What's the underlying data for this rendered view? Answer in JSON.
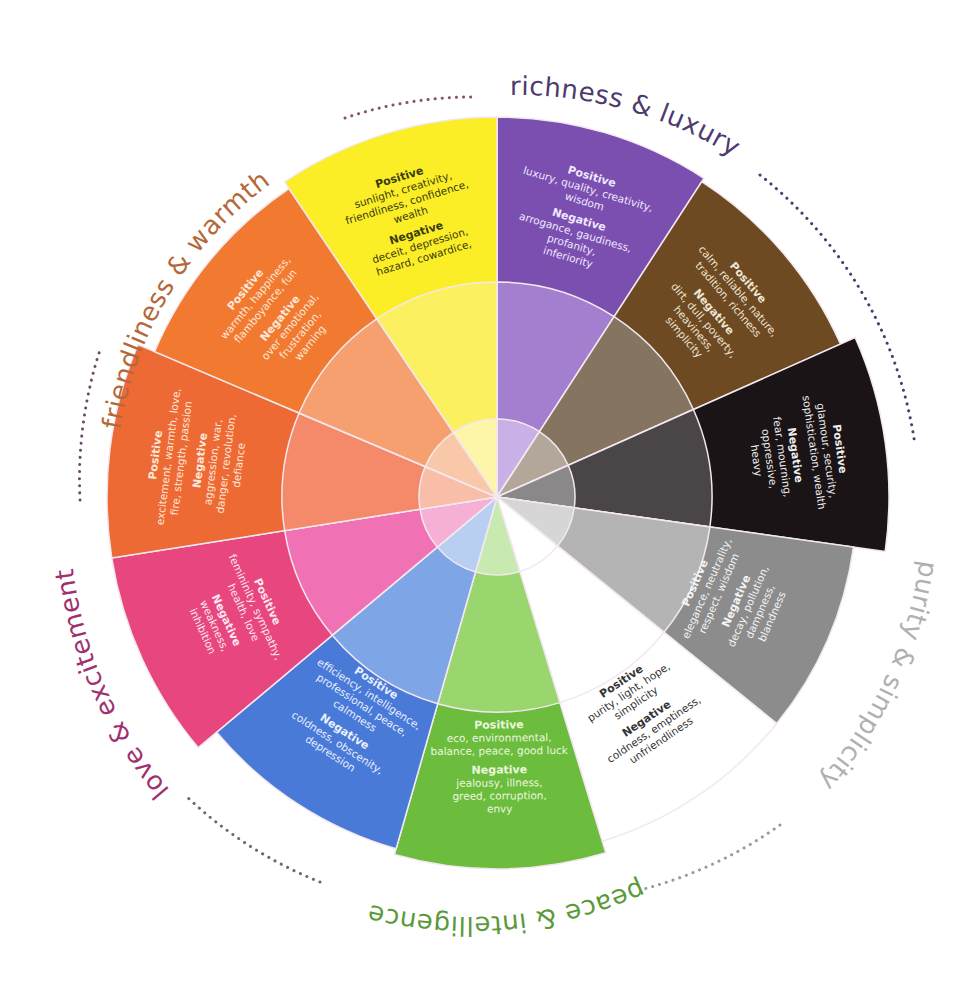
{
  "center": {
    "x": 497,
    "y": 497
  },
  "categories": [
    {
      "id": "friendliness",
      "label": "friendliness & warmth",
      "color": "#b4683a",
      "dot_color": "#8a4d6e"
    },
    {
      "id": "richness",
      "label": "richness & luxury",
      "color": "#4e3a6e",
      "dot_color": "#4e3a6e"
    },
    {
      "id": "purity",
      "label": "purity & simplicity",
      "color": "#b0b0b0",
      "dot_color": "#9a9a9a"
    },
    {
      "id": "peace",
      "label": "peace & intelligence",
      "color": "#5a9a3a",
      "dot_color": "#6a6a6a"
    },
    {
      "id": "love",
      "label": "love & excitement",
      "color": "#a0306e",
      "dot_color": "#6a4a6a"
    }
  ],
  "segments": [
    {
      "id": "purple",
      "color": "#7b4fb0",
      "mid": "#a47fd0",
      "inner": "#c9b0e6",
      "start": 0,
      "end": 33,
      "r": 380,
      "text_color": "#f0e8ff",
      "positive_label": "Positive",
      "positive": [
        "luxury, quality, creativity,",
        "wisdom"
      ],
      "negative_label": "Negative",
      "negative": [
        "arrogance, gaudiness,",
        "profanity,",
        "inferiority"
      ]
    },
    {
      "id": "brown",
      "color": "#6e4a22",
      "mid": "#857560",
      "inner": "#b3a79a",
      "start": 33,
      "end": 66,
      "r": 376,
      "text_color": "#efe6d6",
      "positive_label": "Positive",
      "positive": [
        "calm, reliable, nature,",
        "tradition, richness"
      ],
      "negative_label": "Negative",
      "negative": [
        "dirt, dull, poverty,",
        "heaviness,",
        "simplicity"
      ]
    },
    {
      "id": "black",
      "color": "#1a1416",
      "mid": "#4a4648",
      "inner": "#8a8888",
      "start": 66,
      "end": 98,
      "r": 392,
      "text_color": "#eeeeee",
      "positive_label": "Positive",
      "positive": [
        "glamour, security,",
        "sophistication, wealth"
      ],
      "negative_label": "Negative",
      "negative": [
        "fear, mourning,",
        "oppressive,",
        "heavy"
      ]
    },
    {
      "id": "gray",
      "color": "#8c8c8c",
      "mid": "#b4b4b4",
      "inner": "#d6d6d6",
      "start": 98,
      "end": 129,
      "r": 360,
      "text_color": "#f4f4f4",
      "positive_label": "Positive",
      "positive": [
        "elegance, neutrality,",
        "respect, wisdom"
      ],
      "negative_label": "Negative",
      "negative": [
        "decay, pollution,",
        "dampness,",
        "blandness"
      ]
    },
    {
      "id": "white",
      "color": "#ffffff",
      "mid": "#ffffff",
      "inner": "#ffffff",
      "start": 129,
      "end": 163,
      "r": 360,
      "text_color": "#333333",
      "positive_label": "Positive",
      "positive": [
        "purity, light, hope,",
        "simplicity"
      ],
      "negative_label": "Negative",
      "negative": [
        "coldness, emptiness,",
        "unfriendliness"
      ]
    },
    {
      "id": "green",
      "color": "#6cbc3e",
      "mid": "#9ad66e",
      "inner": "#c8eab0",
      "start": 163,
      "end": 196,
      "r": 372,
      "text_color": "#eaf8de",
      "positive_label": "Positive",
      "positive": [
        "eco, environmental,",
        "balance, peace, good luck"
      ],
      "negative_label": "Negative",
      "negative": [
        "jealousy, illness,",
        "greed, corruption,",
        "envy"
      ]
    },
    {
      "id": "blue",
      "color": "#4a7ad8",
      "mid": "#7ea6e6",
      "inner": "#b8cff2",
      "start": 196,
      "end": 230,
      "r": 366,
      "text_color": "#e8f0ff",
      "positive_label": "Positive",
      "positive": [
        "efficiency, intelligence,",
        "professional, peace,",
        "calmness"
      ],
      "negative_label": "Negative",
      "negative": [
        "coldness, obscenity,",
        "depression"
      ]
    },
    {
      "id": "pink",
      "color": "#e8467e",
      "mid": "#f072b4",
      "inner": "#f6b0d4",
      "start": 230,
      "end": 261,
      "r": 390,
      "text_color": "#fde6ef",
      "positive_label": "Positive",
      "positive": [
        "femininity, sympathy,",
        "health, love"
      ],
      "negative_label": "Negative",
      "negative": [
        "weakness,",
        "inhibition"
      ]
    },
    {
      "id": "red-orange",
      "color": "#ee6a34",
      "mid": "#f58a6a",
      "inner": "#f8bea8",
      "start": 261,
      "end": 293,
      "r": 390,
      "text_color": "#fde8dc",
      "positive_label": "Positive",
      "positive": [
        "excitement, warmth, love,",
        "fire, strength, passion"
      ],
      "negative_label": "Negative",
      "negative": [
        "aggression, war,",
        "danger, revolution,",
        "defiance"
      ]
    },
    {
      "id": "orange",
      "color": "#f27a30",
      "mid": "#f6a070",
      "inner": "#f8c8a8",
      "start": 293,
      "end": 326,
      "r": 372,
      "text_color": "#fde8dc",
      "positive_label": "Positive",
      "positive": [
        "warmth, happiness,",
        "flamboyance, fun"
      ],
      "negative_label": "Negative",
      "negative": [
        "over emotional,",
        "frustration,",
        "warning"
      ]
    },
    {
      "id": "yellow",
      "color": "#fbee26",
      "mid": "#fbf060",
      "inner": "#fdf6a8",
      "start": 326,
      "end": 360,
      "r": 380,
      "text_color": "#3a3a10",
      "positive_label": "Positive",
      "positive": [
        "sunlight, creativity,",
        "friendliness, confidence,",
        "wealth"
      ],
      "negative_label": "Negative",
      "negative": [
        "deceit, depression,",
        "hazard, cowardice,"
      ]
    }
  ]
}
